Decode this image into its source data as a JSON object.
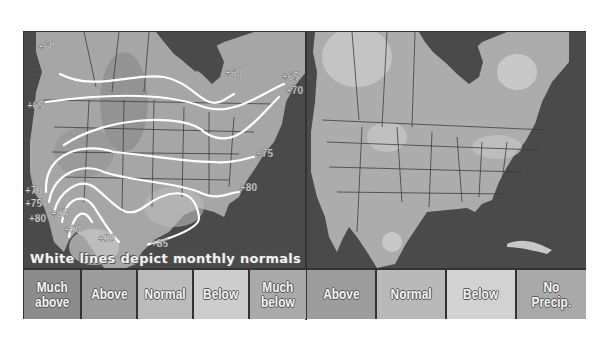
{
  "figure": {
    "left_map": {
      "title": "Temperature outlook",
      "caption": "White lines depict monthly normals",
      "isotherm_labels": [
        {
          "text": "+60",
          "x": 14,
          "y": 18
        },
        {
          "text": "+60",
          "x": 201,
          "y": 44
        },
        {
          "text": "+65",
          "x": 258,
          "y": 48
        },
        {
          "text": "+65",
          "x": 3,
          "y": 77
        },
        {
          "text": "+70",
          "x": 262,
          "y": 62
        },
        {
          "text": "+75",
          "x": 232,
          "y": 125
        },
        {
          "text": "+80",
          "x": 216,
          "y": 159
        },
        {
          "text": "+70",
          "x": 1,
          "y": 162
        },
        {
          "text": "+75",
          "x": 1,
          "y": 175
        },
        {
          "text": "+80",
          "x": 5,
          "y": 190
        },
        {
          "text": "+85",
          "x": 27,
          "y": 185
        },
        {
          "text": "+90",
          "x": 40,
          "y": 201
        },
        {
          "text": "+90",
          "x": 74,
          "y": 210
        },
        {
          "text": "+85",
          "x": 127,
          "y": 215
        }
      ],
      "legend": [
        {
          "label": "Much\nabove",
          "color": "#8c8c8c"
        },
        {
          "label": "Above",
          "color": "#9d9d9d"
        },
        {
          "label": "Normal",
          "color": "#bcbcbc"
        },
        {
          "label": "Below",
          "color": "#cdcdcd"
        },
        {
          "label": "Much\nbelow",
          "color": "#aaaaaa"
        }
      ]
    },
    "right_map": {
      "title": "Precipitation outlook",
      "legend": [
        {
          "label": "Above",
          "color": "#9d9d9d"
        },
        {
          "label": "Normal",
          "color": "#b9b9b9"
        },
        {
          "label": "Below",
          "color": "#d2d2d2"
        },
        {
          "label": "No\nPrecip.",
          "color": "#a9a9a9"
        }
      ]
    },
    "colors": {
      "water": "#4a4a4a",
      "land": "#a8a8a8",
      "border": "#333333",
      "isotherm": "#ffffff"
    }
  }
}
